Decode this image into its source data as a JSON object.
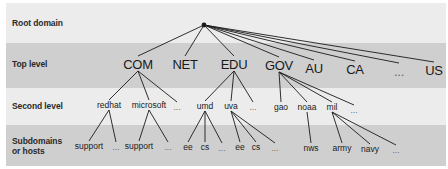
{
  "row_labels": {
    "root": "Root domain",
    "top": "Top level",
    "second": "Second level",
    "sub_line1": "Subdomains",
    "sub_line2": "or hosts"
  },
  "colors": {
    "band_light": "#ececec",
    "band_dark": "#cfcfcf",
    "line": "#1a1a1a"
  },
  "root_node": {
    "x": 204,
    "y": 25
  },
  "top_level": [
    {
      "label": "COM",
      "x": 138,
      "y": 64
    },
    {
      "label": "NET",
      "x": 185,
      "y": 64
    },
    {
      "label": "EDU",
      "x": 234,
      "y": 64
    },
    {
      "label": "GOV",
      "x": 279,
      "y": 65
    },
    {
      "label": "AU",
      "x": 314,
      "y": 68
    },
    {
      "label": "CA",
      "x": 355,
      "y": 69
    },
    {
      "label": "...",
      "x": 399,
      "y": 71
    },
    {
      "label": "US",
      "x": 434,
      "y": 70
    }
  ],
  "second_level": [
    {
      "label": "redhat",
      "x": 109,
      "y": 105,
      "parent": "COM"
    },
    {
      "label": "microsoft",
      "x": 149,
      "y": 105,
      "parent": "COM"
    },
    {
      "label": "...",
      "x": 177,
      "y": 107,
      "parent": "COM"
    },
    {
      "label": "umd",
      "x": 205,
      "y": 106,
      "parent": "EDU"
    },
    {
      "label": "uva",
      "x": 231,
      "y": 106,
      "parent": "EDU"
    },
    {
      "label": "...",
      "x": 253,
      "y": 107,
      "parent": "EDU"
    },
    {
      "label": "gao",
      "x": 281,
      "y": 107,
      "parent": "GOV"
    },
    {
      "label": "noaa",
      "x": 307,
      "y": 107,
      "parent": "GOV"
    },
    {
      "label": "mil",
      "x": 332,
      "y": 107,
      "parent": "GOV"
    },
    {
      "label": "...",
      "x": 354,
      "y": 110,
      "parent": "GOV"
    }
  ],
  "subdomains": [
    {
      "label": "support",
      "x": 89,
      "y": 146,
      "parent": "redhat"
    },
    {
      "label": "...",
      "x": 116,
      "y": 147,
      "parent": "redhat"
    },
    {
      "label": "support",
      "x": 139,
      "y": 146,
      "parent": "microsoft"
    },
    {
      "label": "...",
      "x": 168,
      "y": 147,
      "parent": "microsoft"
    },
    {
      "label": "ee",
      "x": 188,
      "y": 147,
      "parent": "umd"
    },
    {
      "label": "cs",
      "x": 205,
      "y": 147,
      "parent": "umd"
    },
    {
      "label": "...",
      "x": 222,
      "y": 148,
      "parent": "umd"
    },
    {
      "label": "ee",
      "x": 240,
      "y": 147,
      "parent": "uva"
    },
    {
      "label": "cs",
      "x": 256,
      "y": 147,
      "parent": "uva"
    },
    {
      "label": "...",
      "x": 275,
      "y": 148,
      "parent": "uva"
    },
    {
      "label": "nws",
      "x": 311,
      "y": 148,
      "parent": "noaa"
    },
    {
      "label": "army",
      "x": 342,
      "y": 148,
      "parent": "mil"
    },
    {
      "label": "navy",
      "x": 370,
      "y": 149,
      "parent": "mil"
    },
    {
      "label": "...",
      "x": 396,
      "y": 150,
      "parent": "mil"
    }
  ]
}
